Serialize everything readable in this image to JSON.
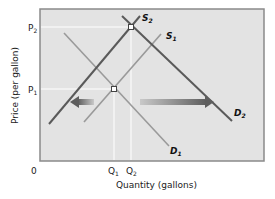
{
  "diagram": {
    "type": "supply-demand-shift",
    "x_axis_title": "Quantity (gallons)",
    "y_axis_title": "Price (per gallon)",
    "origin_label": "0",
    "price_levels": [
      {
        "label": "P",
        "sub": "1",
        "name": "p1"
      },
      {
        "label": "P",
        "sub": "2",
        "name": "p2"
      }
    ],
    "quantity_levels": [
      {
        "label": "Q",
        "sub": "1",
        "name": "q1"
      },
      {
        "label": "Q",
        "sub": "2",
        "name": "q2"
      }
    ],
    "curves": [
      {
        "label": "S",
        "sub": "1",
        "name": "supply-1"
      },
      {
        "label": "S",
        "sub": "2",
        "name": "supply-2"
      },
      {
        "label": "D",
        "sub": "1",
        "name": "demand-1"
      },
      {
        "label": "D",
        "sub": "2",
        "name": "demand-2"
      }
    ],
    "arrows": [
      {
        "direction": "left",
        "meaning": "supply shift left (S1 to S2)"
      },
      {
        "direction": "right",
        "meaning": "demand shift right (D1 to D2)"
      }
    ],
    "colors": {
      "plot_background": "#e3e3e3",
      "frame": "#8a8a8a",
      "dark_curve": "#5a5a5a",
      "light_curve": "#9a9a9a",
      "guide_line": "#ffffff",
      "arrow": "#6e6e6e"
    }
  }
}
